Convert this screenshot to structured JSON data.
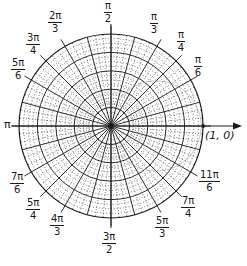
{
  "diagram": {
    "center": {
      "x": 111,
      "y": 126
    },
    "outer_radius": 92,
    "solid_rings": 5,
    "dotted_rings_per_gap": 3,
    "radial_step_deg": 15,
    "fine_radial_step_deg": 5,
    "line_color": "#1a1a1a",
    "dotted_color": "#333333",
    "faint_curve_color": "#9a9a9a",
    "axis_arrow_tip_x": 242,
    "point_label": "(1, 0)",
    "left_axis_label": "π",
    "angle_labels": [
      {
        "id": "pi-2",
        "num": "π",
        "den": "2",
        "x": 104,
        "y": 1
      },
      {
        "id": "pi-3",
        "num": "π",
        "den": "3",
        "x": 150,
        "y": 12
      },
      {
        "id": "pi-4",
        "num": "π",
        "den": "4",
        "x": 177,
        "y": 30
      },
      {
        "id": "pi-6",
        "num": "π",
        "den": "6",
        "x": 194,
        "y": 55
      },
      {
        "id": "2pi-3",
        "num": "2π",
        "den": "3",
        "x": 48,
        "y": 11
      },
      {
        "id": "3pi-4",
        "num": "3π",
        "den": "4",
        "x": 26,
        "y": 33
      },
      {
        "id": "5pi-6",
        "num": "5π",
        "den": "6",
        "x": 11,
        "y": 58
      },
      {
        "id": "7pi-6",
        "num": "7π",
        "den": "6",
        "x": 10,
        "y": 172
      },
      {
        "id": "5pi-4",
        "num": "5π",
        "den": "4",
        "x": 26,
        "y": 198
      },
      {
        "id": "4pi-3",
        "num": "4π",
        "den": "3",
        "x": 50,
        "y": 214
      },
      {
        "id": "3pi-2",
        "num": "3π",
        "den": "2",
        "x": 102,
        "y": 232
      },
      {
        "id": "5pi-3",
        "num": "5π",
        "den": "3",
        "x": 155,
        "y": 216
      },
      {
        "id": "7pi-4",
        "num": "7π",
        "den": "4",
        "x": 181,
        "y": 196
      },
      {
        "id": "11pi-6",
        "num": "11π",
        "den": "6",
        "x": 199,
        "y": 170
      }
    ]
  }
}
